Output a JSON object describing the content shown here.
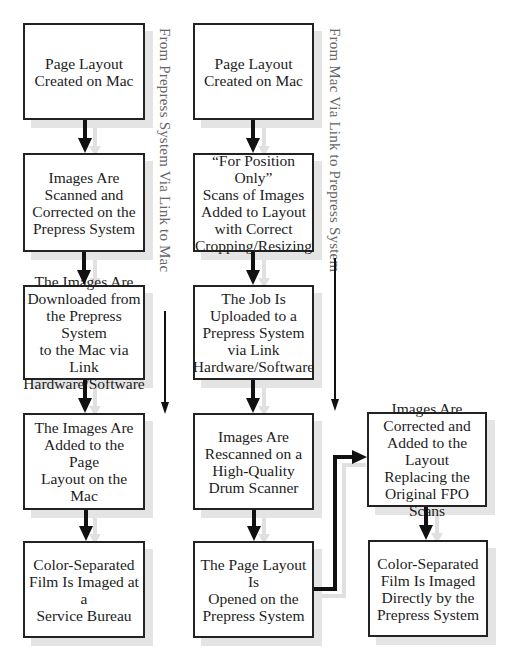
{
  "diagram": {
    "flows": [
      {
        "name": "left-flow",
        "side_label": "From Prepress System Via Link to Mac",
        "steps": [
          "Page Layout\nCreated on Mac",
          "Images Are\nScanned and\nCorrected on the\nPrepress System",
          "The Images Are\nDownloaded from\nthe Prepress System\nto the Mac via Link\nHardware/Software",
          "The Images Are\nAdded to the Page\nLayout on the Mac",
          "Color-Separated\nFilm Is Imaged at a\nService Bureau"
        ]
      },
      {
        "name": "middle-flow",
        "side_label": "From Mac Via Link to Prepress System",
        "steps": [
          "Page Layout\nCreated on Mac",
          "“For Position Only”\nScans of Images\nAdded to Layout\nwith Correct\nCropping/Resizing",
          "The Job Is\nUploaded to a\nPrepress System\nvia Link\nHardware/Software",
          "Images Are\nRescanned on a\nHigh-Quality\nDrum Scanner",
          "The Page Layout Is\nOpened on the\nPrepress System"
        ]
      },
      {
        "name": "right-flow",
        "steps": [
          "Images Are\nCorrected and\nAdded to the Layout\nReplacing the\nOriginal FPO Scans",
          "Color-Separated\nFilm Is Imaged\nDirectly by the\nPrepress System"
        ]
      }
    ],
    "colors": {
      "box_border": "#222222",
      "shadow": "#e4e4e4",
      "arrow": "#111111",
      "side_label": "#666666"
    }
  }
}
